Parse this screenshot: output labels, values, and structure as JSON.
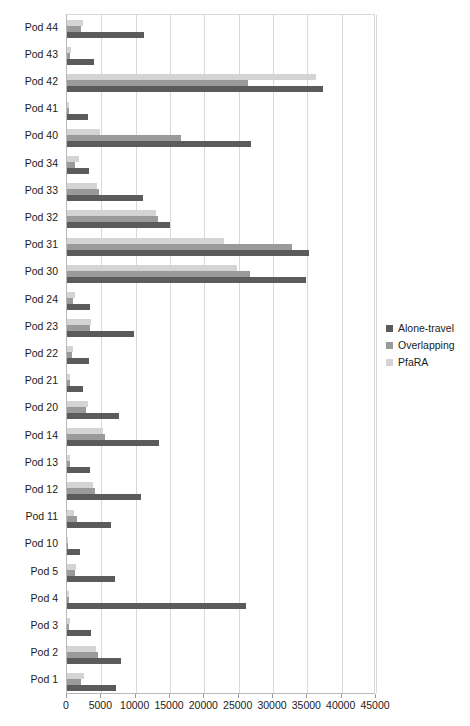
{
  "chart_data": {
    "type": "bar",
    "orientation": "horizontal",
    "title": "",
    "xlabel": "",
    "ylabel": "",
    "xlim": [
      0,
      45000
    ],
    "xticks": [
      0,
      5000,
      10000,
      15000,
      20000,
      25000,
      30000,
      35000,
      40000,
      45000
    ],
    "tick_labels": [
      "0",
      "5000",
      "10000",
      "15000",
      "20000",
      "25000",
      "30000",
      "35000",
      "40000",
      "45000"
    ],
    "grid": true,
    "legend_position": "right",
    "categories": [
      "Pod 44",
      "Pod 43",
      "Pod 42",
      "Pod 41",
      "Pod 40",
      "Pod 34",
      "Pod 33",
      "Pod 32",
      "Pod 31",
      "Pod 30",
      "Pod 24",
      "Pod 23",
      "Pod 22",
      "Pod 21",
      "Pod 20",
      "Pod 14",
      "Pod 13",
      "Pod 12",
      "Pod 11",
      "Pod 10",
      "Pod 5",
      "Pod 4",
      "Pod 3",
      "Pod 2",
      "Pod 1"
    ],
    "series": [
      {
        "name": "Alone-travel",
        "color": "#5b5b5b",
        "values": [
          11200,
          4000,
          37300,
          3000,
          26800,
          3200,
          11100,
          15000,
          35200,
          34800,
          3300,
          9700,
          3200,
          2400,
          7600,
          13400,
          3300,
          10800,
          6400,
          1900,
          7000,
          26000,
          3500,
          7800,
          7100
        ]
      },
      {
        "name": "Overlapping",
        "color": "#9a9a9a",
        "values": [
          2100,
          500,
          26300,
          250,
          16600,
          1200,
          4600,
          13200,
          32800,
          26700,
          900,
          3400,
          700,
          400,
          2700,
          5600,
          450,
          4100,
          1400,
          150,
          1100,
          250,
          350,
          4500,
          2100
        ]
      },
      {
        "name": "PfaRA",
        "color": "#d4d4d4",
        "values": [
          2300,
          550,
          36300,
          300,
          4800,
          1800,
          4400,
          12900,
          22800,
          24700,
          1100,
          3500,
          900,
          500,
          3000,
          5300,
          500,
          3800,
          1000,
          200,
          1300,
          300,
          400,
          4200,
          2500
        ]
      }
    ]
  },
  "legend": {
    "items": [
      {
        "label": "Alone-travel",
        "color": "#5b5b5b"
      },
      {
        "label": "Overlapping",
        "color": "#9a9a9a"
      },
      {
        "label": "PfaRA",
        "color": "#d4d4d4"
      }
    ]
  }
}
